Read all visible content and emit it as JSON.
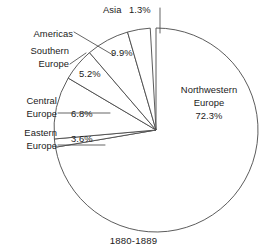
{
  "caption": "1880-1889",
  "chart_data": {
    "type": "pie",
    "title": "1880-1889",
    "subtitle": "",
    "xlabel": "",
    "ylabel": "",
    "grid": false,
    "legend_position": "callout-labels",
    "start_angle_deg": 90,
    "direction": "counterclockwise",
    "units": "percent",
    "categories": [
      "Northwestern Europe",
      "Asia",
      "Americas",
      "Southern Europe",
      "Central Europe",
      "Eastern Europe"
    ],
    "values": [
      72.3,
      1.3,
      9.9,
      5.2,
      6.8,
      3.6
    ],
    "slices": [
      {
        "name": "Northwestern Europe",
        "label": "Northwestern\nEurope",
        "label_line1": "Northwestern",
        "label_line2": "Europe",
        "percent": 72.3,
        "percent_text": "72.3%",
        "label_placement": "inside"
      },
      {
        "name": "Asia",
        "label": "Asia",
        "percent": 1.3,
        "percent_text": "1.3%",
        "label_placement": "callout"
      },
      {
        "name": "Americas",
        "label": "Americas",
        "percent": 9.9,
        "percent_text": "9.9%",
        "label_placement": "callout"
      },
      {
        "name": "Southern Europe",
        "label": "Southern Europe",
        "label_line1": "Southern",
        "label_line2": "Europe",
        "percent": 5.2,
        "percent_text": "5.2%",
        "label_placement": "callout"
      },
      {
        "name": "Central Europe",
        "label": "Central Europe",
        "label_line1": "Central",
        "label_line2": "Europe",
        "percent": 6.8,
        "percent_text": "6.8%",
        "label_placement": "callout"
      },
      {
        "name": "Eastern Europe",
        "label": "Eastern Europe",
        "label_line1": "Eastern",
        "label_line2": "Europe",
        "percent": 3.6,
        "percent_text": "3.6%",
        "label_placement": "callout"
      }
    ],
    "colors": {
      "slice_fill": "#ffffff",
      "slice_stroke": "#4a4a4a",
      "leader_line": "#4a4a4a",
      "text": "#1a1a1a",
      "background": "#ffffff"
    }
  },
  "labels": {
    "asia_name": "Asia",
    "asia_pct": "1.3%",
    "americas_name": "Americas",
    "americas_pct": "9.9%",
    "southern_line1": "Southern",
    "southern_line2": "Europe",
    "southern_pct": "5.2%",
    "central_line1": "Central",
    "central_line2": "Europe",
    "central_pct": "6.8%",
    "eastern_line1": "Eastern",
    "eastern_line2": "Europe",
    "eastern_pct": "3.6%",
    "nw_line1": "Northwestern",
    "nw_line2": "Europe",
    "nw_pct": "72.3%"
  }
}
